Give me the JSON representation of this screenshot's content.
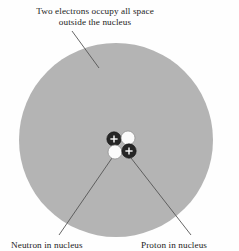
{
  "figure": {
    "title_text_line1": "Two electrons occupy all space",
    "title_text_line2": "outside the nucleus",
    "label_neutron": "Neutron in nucleus",
    "label_proton": "Proton in nucleus",
    "background_color": "#fefefe",
    "electron_cloud_color": "#b4b4b4",
    "proton_color": "#262626",
    "neutron_color": "#fbfbfb",
    "leader_line_color": "#555555",
    "text_color": "#1c1c1c"
  },
  "diagram": {
    "type": "atomic-structure-helium",
    "electron_cloud": {
      "name": "electron-cloud",
      "cx": 116,
      "cy": 140,
      "r": 97,
      "fill": "#b4b4b4"
    },
    "particles": [
      {
        "name": "proton-upper-left",
        "kind": "proton",
        "cx": 114,
        "cy": 139,
        "r": 7.2,
        "charge": "+"
      },
      {
        "name": "neutron-upper-right",
        "kind": "neutron",
        "cx": 128,
        "cy": 138,
        "r": 7.0,
        "charge": ""
      },
      {
        "name": "neutron-lower-left",
        "kind": "neutron",
        "cx": 115,
        "cy": 152,
        "r": 7.0,
        "charge": ""
      },
      {
        "name": "proton-lower-right",
        "kind": "proton",
        "cx": 129,
        "cy": 151,
        "r": 7.2,
        "charge": "+"
      }
    ],
    "leader_lines": [
      {
        "name": "leader-line-electron",
        "x1": 72,
        "y1": 31,
        "x2": 99,
        "y2": 68
      },
      {
        "name": "leader-line-neutron",
        "x1": 112,
        "y1": 158,
        "x2": 59,
        "y2": 235
      },
      {
        "name": "leader-line-proton",
        "x1": 131,
        "y1": 158,
        "x2": 191,
        "y2": 235
      }
    ]
  }
}
